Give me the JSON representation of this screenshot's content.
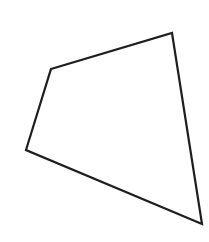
{
  "diagram": {
    "shape": "quadrilateral",
    "vertices": [
      {
        "x": 51,
        "y": 69
      },
      {
        "x": 172,
        "y": 33
      },
      {
        "x": 202,
        "y": 224
      },
      {
        "x": 26,
        "y": 150
      }
    ],
    "stroke_color": "#1e1e1e",
    "stroke_width": 2.2,
    "fill_color": "#ffffff",
    "labels": []
  }
}
